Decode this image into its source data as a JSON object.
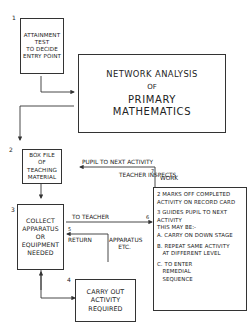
{
  "diagram": {
    "title": {
      "line1": "NETWORK ANALYSIS",
      "line2": "OF",
      "line3": "PRIMARY",
      "line4": "MATHEMATICS"
    },
    "nodes": [
      {
        "number": "1",
        "text": "ATTAINMENT\nTEST\nTO DECIDE\nENTRY POINT"
      },
      {
        "number": "2",
        "text": "BOX FILE\nOF\nTEACHING\nMATERIAL"
      },
      {
        "number": "3",
        "text": "COLLECT\nAPPARATUS\nOR\nEQUIPMENT\nNEEDED"
      },
      {
        "number": "4",
        "text": "CARRY OUT\nACTIVITY\nREQUIRED"
      }
    ],
    "teacher_box": {
      "items": [
        "2 MARKS OFF COMPLETED\nACTIVITY ON RECORD CARD",
        "3 GUIDES PUPIL TO NEXT\nACTIVITY\nTHIS MAY BE:-",
        "A. CARRY ON DOWN STAGE",
        "B. REPEAT SAME ACTIVITY\n   AT DIFFERENT LEVEL",
        "C. TO ENTER\n   REMEDIAL\n   SEQUENCE"
      ]
    },
    "edge_labels": {
      "pupil_next": "PUPIL TO NEXT ACTIVITY",
      "teacher_inspects": "TEACHER INSPECTS",
      "work": "WORK",
      "step7": "7",
      "to_teacher": "TO TEACHER",
      "step6": "6",
      "return": "RETURN",
      "step5": "5",
      "apparatus": "APPARATUS\n     ETC."
    },
    "colors": {
      "ink": "#222222",
      "paper": "#ffffff"
    }
  }
}
